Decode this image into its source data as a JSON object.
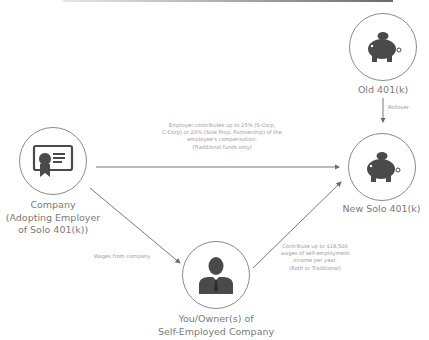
{
  "colors": {
    "icon": "#4a4a4a",
    "line": "#6a6a6a",
    "circle": "#8a8a8a",
    "text": "#7a7a7a"
  },
  "nodes": {
    "old": {
      "label": "Old 401(k)",
      "icon": "piggy-bank-icon"
    },
    "new": {
      "label": "New Solo 401(k)",
      "icon": "piggy-bank-icon"
    },
    "company": {
      "label_lines": [
        "Company",
        "(Adopting Employer",
        "of Solo 401(k))"
      ],
      "icon": "certificate-icon"
    },
    "owner": {
      "label_lines": [
        "You/Owner(s) of",
        "Self-Employed Company"
      ],
      "icon": "person-icon"
    }
  },
  "edges": {
    "rollover": {
      "label": "Rollover"
    },
    "employer": {
      "label_lines": [
        "Employer contributes up to 25% (S-Corp,",
        "C-Corp) or 20% (Sole Prop, Partnership) of the",
        "employee's compensation.",
        "(Traditional funds only)"
      ]
    },
    "wages": {
      "label": "Wages from company"
    },
    "employee": {
      "label_lines": [
        "Contribute up to $18,500",
        "wages of self-employment",
        "income per year.",
        "(Roth or Traditional)"
      ]
    }
  }
}
